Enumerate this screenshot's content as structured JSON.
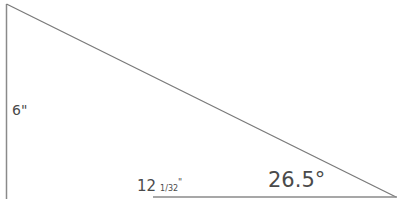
{
  "diagram": {
    "type": "right-triangle",
    "stroke_color": "#7a7a7a",
    "vertical_side": {
      "label": "6\""
    },
    "horizontal_side": {
      "label_whole": "12",
      "label_fraction": "1/32",
      "label_unit": "\""
    },
    "angle": {
      "label": "26.5°"
    }
  }
}
